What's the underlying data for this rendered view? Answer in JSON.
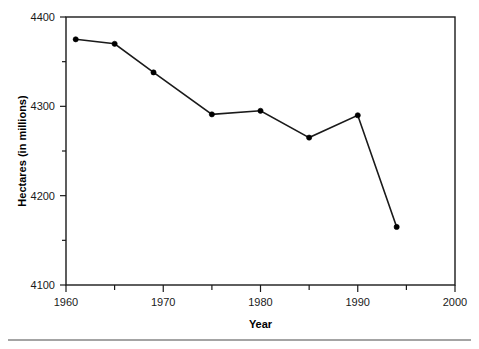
{
  "chart_data": {
    "type": "line",
    "title": "",
    "subtitle": "",
    "xlabel": "Year",
    "ylabel": "Hectares (in millions)",
    "xlim": [
      1960,
      2000
    ],
    "ylim": [
      4100,
      4400
    ],
    "grid": false,
    "legend": null,
    "legend_position": "none",
    "x_ticks_major": [
      1960,
      1970,
      1980,
      1990,
      2000
    ],
    "x_ticks_minor": [
      1965,
      1975,
      1985,
      1995
    ],
    "y_ticks_major": [
      4100,
      4200,
      4300,
      4400
    ],
    "y_ticks_minor": [
      4150,
      4250,
      4350
    ],
    "x_tick_labels": [
      "1960",
      "1970",
      "1980",
      "1990",
      "2000"
    ],
    "y_tick_labels": [
      "4100",
      "4200",
      "4300",
      "4400"
    ],
    "marker": "filled-circle",
    "line_color": "#1a1a1a",
    "marker_color": "#000000",
    "series": [
      {
        "name": "Hectares",
        "x": [
          1961,
          1965,
          1969,
          1975,
          1980,
          1985,
          1990,
          1994
        ],
        "values": [
          4375,
          4370,
          4338,
          4291,
          4295,
          4265,
          4290,
          4165
        ]
      }
    ],
    "points": [
      {
        "x": 1961,
        "y": 4375
      },
      {
        "x": 1965,
        "y": 4370
      },
      {
        "x": 1969,
        "y": 4338
      },
      {
        "x": 1975,
        "y": 4291
      },
      {
        "x": 1980,
        "y": 4295
      },
      {
        "x": 1985,
        "y": 4265
      },
      {
        "x": 1990,
        "y": 4290
      },
      {
        "x": 1994,
        "y": 4165
      }
    ]
  },
  "axis": {
    "y_top_label": "4400",
    "y_third_label": "4300",
    "y_second_label": "4200",
    "y_bottom_label": "4100",
    "x_label_1": "1960",
    "x_label_2": "1970",
    "x_label_3": "1980",
    "x_label_4": "1990",
    "x_label_5": "2000",
    "x_title": "Year",
    "y_title": "Hectares (in millions)"
  }
}
